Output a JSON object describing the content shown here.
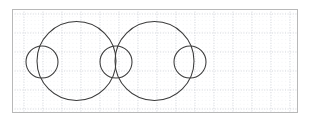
{
  "figure": {
    "background_color": "#ffffff",
    "stroke_color": "#3a3a3a",
    "frame": {
      "label": "graph-paper-frame",
      "x": 12,
      "y": 9,
      "width": 286,
      "height": 104,
      "border_color": "#b8b8b8",
      "border_width": 1,
      "fill": "#ffffff"
    },
    "grid": {
      "major": {
        "label": "major-grid-lines",
        "spacing": 19,
        "color": "#c9cdd4",
        "width": 0.8,
        "dash": "1,1.6",
        "origin_x": 24,
        "origin_y": 14
      },
      "minor": {
        "label": "minor-grid-dots",
        "spacing": 3.8,
        "color": "#e6e8ec",
        "width": 0.5,
        "dash": "0.5,3.3"
      }
    },
    "shapes": {
      "large_circles": [
        {
          "name": "large-circle-left",
          "cx": 76.5,
          "cy": 61,
          "r": 39.5
        },
        {
          "name": "large-circle-right",
          "cx": 154.5,
          "cy": 61,
          "r": 39.5
        }
      ],
      "small_circles": [
        {
          "name": "small-circle-left",
          "cx": 42,
          "cy": 62,
          "r": 16
        },
        {
          "name": "small-circle-middle",
          "cx": 116,
          "cy": 62,
          "r": 16
        },
        {
          "name": "small-circle-right",
          "cx": 190,
          "cy": 62,
          "r": 16
        }
      ],
      "stroke_width": 1.05
    },
    "counts": {
      "large_circles": 2,
      "small_circles": 3,
      "total_circles": 5
    }
  }
}
